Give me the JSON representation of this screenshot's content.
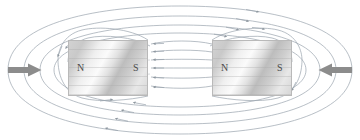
{
  "diagram": {
    "background_color": "#ffffff",
    "field_line_color": "#9aa3ad",
    "arrowhead_color": "#8e979f",
    "force_arrow_color": "#8c8c8c",
    "magnet_border_color": "#b9b9b9",
    "pole_label_color": "#4a4a4a"
  },
  "magnets": [
    {
      "id": "magnet-left",
      "name": "left-bar-magnet",
      "north_label": "N",
      "south_label": "S",
      "x": 68,
      "y": 40,
      "width": 80,
      "height": 56
    },
    {
      "id": "magnet-right",
      "name": "right-bar-magnet",
      "north_label": "N",
      "south_label": "S",
      "x": 212,
      "y": 40,
      "width": 80,
      "height": 56
    }
  ],
  "force_arrows": [
    {
      "id": "force-arrow-left",
      "direction": "right",
      "label": "",
      "color": "#8c8c8c"
    },
    {
      "id": "force-arrow-right",
      "direction": "left",
      "label": "",
      "color": "#8c8c8c"
    }
  ],
  "field_lines": {
    "gap_lines_count": 6,
    "gap_line_direction": "left",
    "outer_loops_count": 8,
    "loop_direction": "clockwise-top"
  }
}
